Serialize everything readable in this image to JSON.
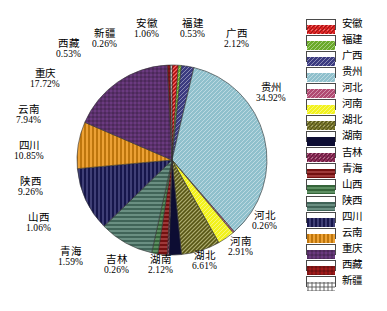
{
  "chart_data": {
    "type": "pie",
    "title": "",
    "legend_position": "right",
    "categories": [
      "安徽",
      "福建",
      "广西",
      "贵州",
      "河北",
      "河南",
      "湖北",
      "湖南",
      "吉林",
      "青海",
      "山西",
      "陕西",
      "四川",
      "云南",
      "重庆",
      "西藏",
      "新疆"
    ],
    "values": [
      1.06,
      0.53,
      2.12,
      34.92,
      0.26,
      2.91,
      6.61,
      2.12,
      0.26,
      1.59,
      1.06,
      9.26,
      10.85,
      7.94,
      17.72,
      0.53,
      0.26
    ],
    "value_unit": "%",
    "slices": [
      {
        "name": "安徽",
        "value": 1.06,
        "label": "1.06%",
        "color": "#dd2222",
        "pattern": "crosshatch"
      },
      {
        "name": "福建",
        "value": 0.53,
        "label": "0.53%",
        "color": "#6aaa2a",
        "pattern": "diagonal"
      },
      {
        "name": "广西",
        "value": 2.12,
        "label": "2.12%",
        "color": "#3b3b80",
        "pattern": "diagonal"
      },
      {
        "name": "贵州",
        "value": 34.92,
        "label": "34.92%",
        "color": "#8fc0cc",
        "pattern": "diagonal"
      },
      {
        "name": "河北",
        "value": 0.26,
        "label": "0.26%",
        "color": "#b04a72",
        "pattern": "diagonal"
      },
      {
        "name": "河南",
        "value": 2.91,
        "label": "2.91%",
        "color": "#f2f21e",
        "pattern": "diagonal"
      },
      {
        "name": "湖北",
        "value": 6.61,
        "label": "6.61%",
        "color": "#78762a",
        "pattern": "crosshatch"
      },
      {
        "name": "湖南",
        "value": 2.12,
        "label": "2.12%",
        "color": "#0d0d33",
        "pattern": "solid"
      },
      {
        "name": "吉林",
        "value": 0.26,
        "label": "0.26%",
        "color": "#8c2a56",
        "pattern": "crosshatch"
      },
      {
        "name": "青海",
        "value": 1.59,
        "label": "1.59%",
        "color": "#8c1414",
        "pattern": "horizontal"
      },
      {
        "name": "山西",
        "value": 1.06,
        "label": "1.06%",
        "color": "#3f7a45",
        "pattern": "horizontal"
      },
      {
        "name": "陕西",
        "value": 9.26,
        "label": "9.26%",
        "color": "#4e7a6b",
        "pattern": "horizontal"
      },
      {
        "name": "四川",
        "value": 10.85,
        "label": "10.85%",
        "color": "#1b1b5c",
        "pattern": "vertical"
      },
      {
        "name": "云南",
        "value": 7.94,
        "label": "7.94%",
        "color": "#e89010",
        "pattern": "vertical"
      },
      {
        "name": "重庆",
        "value": 17.72,
        "label": "17.72%",
        "color": "#6b3a80",
        "pattern": "grid"
      },
      {
        "name": "西藏",
        "value": 0.53,
        "label": "0.53%",
        "color": "#a01a1a",
        "pattern": "grid"
      },
      {
        "name": "新疆",
        "value": 0.26,
        "label": "0.26%",
        "color": "#ffffff",
        "pattern": "grid-dark"
      }
    ]
  },
  "callouts": [
    {
      "id": "xinjiang",
      "name": "新疆",
      "pct": "0.26%"
    },
    {
      "id": "anhui",
      "name": "安徽",
      "pct": "1.06%"
    },
    {
      "id": "fujian",
      "name": "福建",
      "pct": "0.53%"
    },
    {
      "id": "guangxi",
      "name": "广西",
      "pct": "2.12%"
    },
    {
      "id": "guizhou",
      "name": "贵州",
      "pct": "34.92%"
    },
    {
      "id": "hebei",
      "name": "河北",
      "pct": "0.26%"
    },
    {
      "id": "henan",
      "name": "河南",
      "pct": "2.91%"
    },
    {
      "id": "hubei",
      "name": "湖北",
      "pct": "6.61%"
    },
    {
      "id": "hunan",
      "name": "湖南",
      "pct": "2.12%"
    },
    {
      "id": "jilin",
      "name": "吉林",
      "pct": "0.26%"
    },
    {
      "id": "qinghai",
      "name": "青海",
      "pct": "1.59%"
    },
    {
      "id": "shanxi",
      "name": "山西",
      "pct": "1.06%"
    },
    {
      "id": "shaanxi",
      "name": "陕西",
      "pct": "9.26%"
    },
    {
      "id": "sichuan",
      "name": "四川",
      "pct": "10.85%"
    },
    {
      "id": "yunnan",
      "name": "云南",
      "pct": "7.94%"
    },
    {
      "id": "chongqing",
      "name": "重庆",
      "pct": "17.72%"
    },
    {
      "id": "xizang",
      "name": "西藏",
      "pct": "0.53%"
    }
  ],
  "legend": {
    "items": [
      {
        "label": "安徽",
        "color": "#dd2222"
      },
      {
        "label": "福建",
        "color": "#6aaa2a"
      },
      {
        "label": "广西",
        "color": "#3b3b80"
      },
      {
        "label": "贵州",
        "color": "#8fc0cc"
      },
      {
        "label": "河北",
        "color": "#b04a72"
      },
      {
        "label": "河南",
        "color": "#f2f21e"
      },
      {
        "label": "湖北",
        "color": "#78762a"
      },
      {
        "label": "湖南",
        "color": "#0d0d33"
      },
      {
        "label": "吉林",
        "color": "#8c2a56"
      },
      {
        "label": "青海",
        "color": "#8c1414"
      },
      {
        "label": "山西",
        "color": "#3f7a45"
      },
      {
        "label": "陕西",
        "color": "#4e7a6b"
      },
      {
        "label": "四川",
        "color": "#1b1b5c"
      },
      {
        "label": "云南",
        "color": "#e89010"
      },
      {
        "label": "重庆",
        "color": "#6b3a80"
      },
      {
        "label": "西藏",
        "color": "#a01a1a"
      },
      {
        "label": "新疆",
        "color": "#ffffff"
      }
    ]
  }
}
